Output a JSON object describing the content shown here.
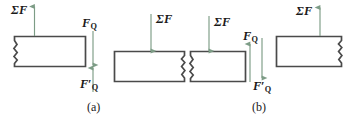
{
  "figure": {
    "title_caption_a": "(a)",
    "title_caption_b": "(b)",
    "colors": {
      "arrow": "#7d9c86",
      "block_stroke": "#4a4a4a",
      "block_fill": "#ffffff",
      "text": "#1a1a1a",
      "background": "#ffffff"
    }
  },
  "panel_a": {
    "caption": "(a)",
    "blocks": [
      {
        "name": "upper-left-block",
        "break_side": "left"
      },
      {
        "name": "lower-right-block",
        "break_side": "right"
      }
    ],
    "arrows": [
      {
        "name": "sum-force-upper-left",
        "direction": "up",
        "label_symbol": "Σ",
        "label_base": "F",
        "label_sub": "",
        "label_prime": false
      },
      {
        "name": "shear-force-FQ",
        "direction": "down",
        "label_symbol": "",
        "label_base": "F",
        "label_sub": "Q",
        "label_prime": false
      },
      {
        "name": "shear-force-FQ-prime",
        "direction": "up",
        "label_symbol": "",
        "label_base": "F",
        "label_sub": "Q",
        "label_prime": true
      },
      {
        "name": "sum-force-lower-right",
        "direction": "down",
        "label_symbol": "Σ",
        "label_base": "F",
        "label_sub": "",
        "label_prime": false
      }
    ]
  },
  "panel_b": {
    "caption": "(b)",
    "blocks": [
      {
        "name": "lower-left-block",
        "break_side": "left"
      },
      {
        "name": "upper-right-block",
        "break_side": "right"
      }
    ],
    "arrows": [
      {
        "name": "sum-force-lower-left",
        "direction": "down",
        "label_symbol": "Σ",
        "label_base": "F",
        "label_sub": "",
        "label_prime": false
      },
      {
        "name": "shear-force-FQ",
        "direction": "up",
        "label_symbol": "",
        "label_base": "F",
        "label_sub": "Q",
        "label_prime": false
      },
      {
        "name": "shear-force-FQ-prime",
        "direction": "down",
        "label_symbol": "",
        "label_base": "F",
        "label_sub": "Q",
        "label_prime": true
      },
      {
        "name": "sum-force-upper-right",
        "direction": "up",
        "label_symbol": "Σ",
        "label_base": "F",
        "label_sub": "",
        "label_prime": false
      }
    ]
  },
  "labels": {
    "a_sumF_left": {
      "sigma": "Σ",
      "base": "F"
    },
    "a_FQ": {
      "base": "F",
      "sub": "Q"
    },
    "a_FQ_prime": {
      "base": "F",
      "prime": "′",
      "sub": "Q"
    },
    "a_sumF_right": {
      "sigma": "Σ",
      "base": "F"
    },
    "b_sumF_left": {
      "sigma": "Σ",
      "base": "F"
    },
    "b_FQ": {
      "base": "F",
      "sub": "Q"
    },
    "b_FQ_prime": {
      "base": "F",
      "prime": "′",
      "sub": "Q"
    },
    "b_sumF_right": {
      "sigma": "Σ",
      "base": "F"
    }
  }
}
